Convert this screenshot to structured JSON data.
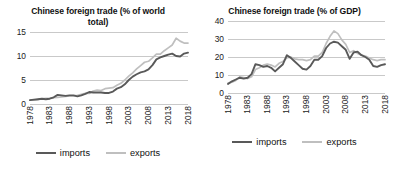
{
  "charts": [
    {
      "title": "Chinese foreign trade (% of world total)",
      "legend": {
        "imports": "imports",
        "exports": "exports"
      }
    },
    {
      "title": "Chinese foreign trade (% of GDP)",
      "legend": {
        "imports": "imports",
        "exports": "exports"
      }
    }
  ],
  "colors": {
    "imports_line": "#595959",
    "exports_line": "#bfbfbf",
    "gridline": "#c9c9c9",
    "text": "#111111",
    "background": "#ffffff"
  },
  "chart_data": [
    {
      "type": "line",
      "title": "Chinese foreign trade (% of world total)",
      "xlabel": "",
      "ylabel": "",
      "ylim": [
        0,
        15
      ],
      "yticks": [
        0,
        5,
        10,
        15
      ],
      "xticks": [
        "1978",
        "1983",
        "1988",
        "1993",
        "1998",
        "2003",
        "2008",
        "2013",
        "2018"
      ],
      "grid": true,
      "legend_position": "bottom",
      "x": [
        1978,
        1979,
        1980,
        1981,
        1982,
        1983,
        1984,
        1985,
        1986,
        1987,
        1988,
        1989,
        1990,
        1991,
        1992,
        1993,
        1994,
        1995,
        1996,
        1997,
        1998,
        1999,
        2000,
        2001,
        2002,
        2003,
        2004,
        2005,
        2006,
        2007,
        2008,
        2009,
        2010,
        2011,
        2012,
        2013,
        2014,
        2015,
        2016,
        2017,
        2018
      ],
      "series": [
        {
          "name": "imports",
          "values": [
            0.8,
            0.9,
            1.0,
            1.1,
            1.0,
            1.1,
            1.4,
            1.9,
            1.8,
            1.7,
            1.8,
            1.8,
            1.6,
            1.8,
            2.1,
            2.5,
            2.4,
            2.4,
            2.4,
            2.3,
            2.3,
            2.6,
            3.2,
            3.5,
            4.1,
            5.0,
            5.7,
            6.2,
            6.6,
            6.8,
            7.2,
            8.1,
            9.3,
            9.7,
            10.0,
            10.3,
            10.5,
            10.0,
            9.9,
            10.5,
            10.7
          ]
        },
        {
          "name": "exports",
          "values": [
            0.8,
            0.8,
            0.9,
            1.1,
            1.2,
            1.2,
            1.3,
            1.4,
            1.5,
            1.6,
            1.7,
            1.7,
            1.8,
            2.0,
            2.2,
            2.2,
            2.7,
            2.9,
            2.8,
            3.2,
            3.3,
            3.4,
            3.9,
            4.3,
            5.0,
            5.8,
            6.5,
            7.3,
            8.0,
            8.7,
            8.9,
            9.6,
            10.4,
            10.4,
            11.1,
            11.7,
            12.3,
            13.7,
            13.1,
            12.7,
            12.7
          ]
        }
      ]
    },
    {
      "type": "line",
      "title": "Chinese foreign trade (% of GDP)",
      "xlabel": "",
      "ylabel": "",
      "ylim": [
        0,
        40
      ],
      "yticks": [
        0,
        10,
        20,
        30,
        40
      ],
      "xticks": [
        "1978",
        "1983",
        "1988",
        "1993",
        "1998",
        "2003",
        "2008",
        "2013",
        "2018"
      ],
      "grid": true,
      "legend_position": "bottom",
      "x": [
        1978,
        1979,
        1980,
        1981,
        1982,
        1983,
        1984,
        1985,
        1986,
        1987,
        1988,
        1989,
        1990,
        1991,
        1992,
        1993,
        1994,
        1995,
        1996,
        1997,
        1998,
        1999,
        2000,
        2001,
        2002,
        2003,
        2004,
        2005,
        2006,
        2007,
        2008,
        2009,
        2010,
        2011,
        2012,
        2013,
        2014,
        2015,
        2016,
        2017,
        2018
      ],
      "series": [
        {
          "name": "imports",
          "values": [
            5.0,
            6.5,
            7.5,
            8.5,
            8.0,
            8.5,
            10.5,
            16.0,
            15.5,
            14.5,
            15.0,
            14.0,
            12.0,
            14.0,
            16.0,
            21.0,
            19.5,
            17.5,
            15.5,
            13.5,
            13.0,
            15.0,
            18.5,
            18.5,
            20.5,
            25.0,
            27.5,
            28.5,
            28.0,
            26.0,
            24.0,
            19.0,
            22.5,
            23.0,
            21.0,
            20.0,
            18.5,
            15.0,
            14.5,
            15.5,
            16.0
          ]
        },
        {
          "name": "exports",
          "values": [
            5.5,
            6.0,
            7.0,
            9.0,
            8.5,
            8.0,
            9.0,
            13.0,
            14.0,
            15.5,
            16.0,
            15.5,
            14.5,
            16.5,
            17.5,
            19.5,
            20.0,
            19.0,
            18.5,
            18.5,
            18.0,
            18.5,
            20.5,
            20.5,
            22.5,
            27.5,
            31.5,
            34.5,
            33.0,
            29.5,
            27.0,
            22.5,
            23.5,
            22.0,
            21.0,
            20.5,
            19.5,
            18.5,
            18.0,
            18.5,
            18.5
          ]
        }
      ]
    }
  ]
}
